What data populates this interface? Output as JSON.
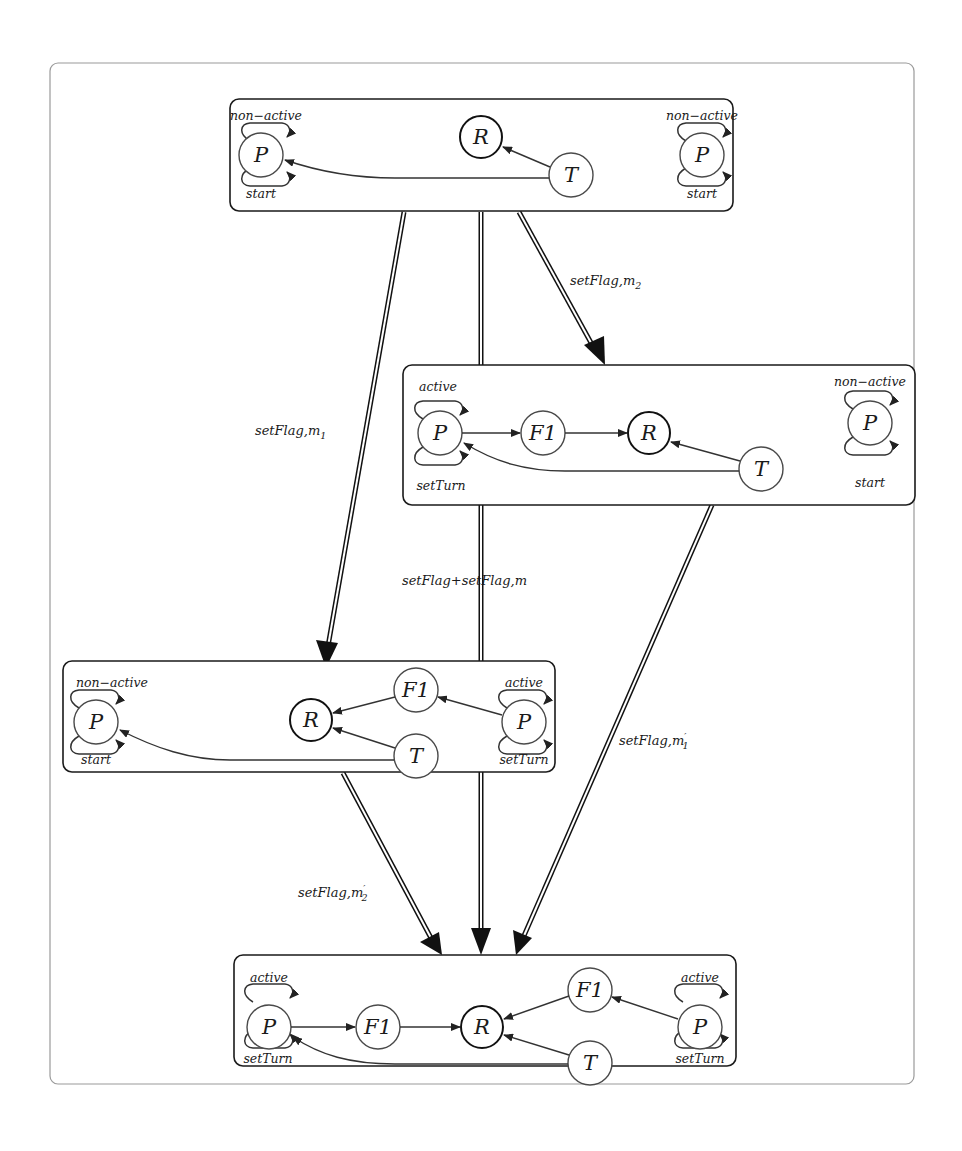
{
  "figure": {
    "type": "state-transition-diagram",
    "states": [
      {
        "id": "s0",
        "nodes": [
          {
            "id": "P_left",
            "label": "P",
            "top_loop": "non-active",
            "bottom_loop": "start"
          },
          {
            "id": "R",
            "label": "R"
          },
          {
            "id": "T",
            "label": "T"
          },
          {
            "id": "P_right",
            "label": "P",
            "top_loop": "non-active",
            "bottom_loop": "start"
          }
        ]
      },
      {
        "id": "s1",
        "nodes": [
          {
            "id": "P_left",
            "label": "P",
            "top_loop": "active",
            "bottom_loop": "setTurn"
          },
          {
            "id": "F1",
            "label": "F1"
          },
          {
            "id": "R",
            "label": "R"
          },
          {
            "id": "T",
            "label": "T"
          },
          {
            "id": "P_right",
            "label": "P",
            "top_loop": "non-active",
            "bottom_loop": "start"
          }
        ]
      },
      {
        "id": "s2",
        "nodes": [
          {
            "id": "P_left",
            "label": "P",
            "top_loop": "non-active",
            "bottom_loop": "start"
          },
          {
            "id": "R",
            "label": "R"
          },
          {
            "id": "F1",
            "label": "F1"
          },
          {
            "id": "T",
            "label": "T"
          },
          {
            "id": "P_right",
            "label": "P",
            "top_loop": "active",
            "bottom_loop": "setTurn"
          }
        ]
      },
      {
        "id": "s3",
        "nodes": [
          {
            "id": "P_left",
            "label": "P",
            "top_loop": "active",
            "bottom_loop": "setTurn"
          },
          {
            "id": "F1_left",
            "label": "F1"
          },
          {
            "id": "R",
            "label": "R"
          },
          {
            "id": "F1_right",
            "label": "F1"
          },
          {
            "id": "T",
            "label": "T"
          },
          {
            "id": "P_right",
            "label": "P",
            "top_loop": "active",
            "bottom_loop": "setTurn"
          }
        ]
      }
    ],
    "transitions": [
      {
        "from": "s0",
        "to": "s1",
        "label": "setFlag,m",
        "sub": "2",
        "prime": ""
      },
      {
        "from": "s0",
        "to": "s2",
        "label": "setFlag,m",
        "sub": "1",
        "prime": ""
      },
      {
        "from": "s0",
        "to": "s3",
        "label": "setFlag+setFlag,m",
        "sub": "",
        "prime": ""
      },
      {
        "from": "s1",
        "to": "s3",
        "label": "setFlag,m",
        "sub": "1",
        "prime": "′"
      },
      {
        "from": "s2",
        "to": "s3",
        "label": "setFlag,m",
        "sub": "2",
        "prime": "′"
      }
    ]
  },
  "labels": {
    "P": "P",
    "R": "R",
    "T": "T",
    "F1": "F1",
    "non_active": "non−active",
    "active": "active",
    "start": "start",
    "setTurn": "setTurn",
    "t_m2": "setFlag,m",
    "t_m2_sub": "2",
    "t_m1": "setFlag,m",
    "t_m1_sub": "1",
    "t_mm": "setFlag+setFlag,m",
    "t_m1p": "setFlag,m",
    "t_m1p_prime": "′",
    "t_m1p_sub": "1",
    "t_m2p": "setFlag,m",
    "t_m2p_prime": "′",
    "t_m2p_sub": "2"
  }
}
